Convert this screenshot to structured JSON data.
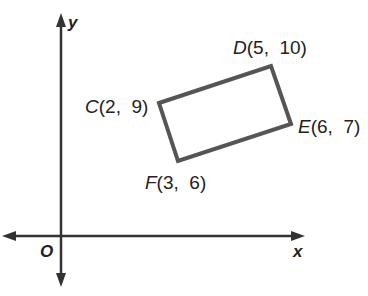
{
  "diagram": {
    "axes": {
      "x_label": "x",
      "y_label": "y",
      "origin_label": "O"
    },
    "quadrilateral": {
      "stroke_color": "#555555",
      "vertices": [
        {
          "name": "C",
          "coords": "(2,  9)",
          "x": 2,
          "y": 9
        },
        {
          "name": "D",
          "coords": "(5,  10)",
          "x": 5,
          "y": 10
        },
        {
          "name": "E",
          "coords": "(6,  7)",
          "x": 6,
          "y": 7
        },
        {
          "name": "F",
          "coords": "(3,  6)",
          "x": 3,
          "y": 6
        }
      ]
    }
  }
}
